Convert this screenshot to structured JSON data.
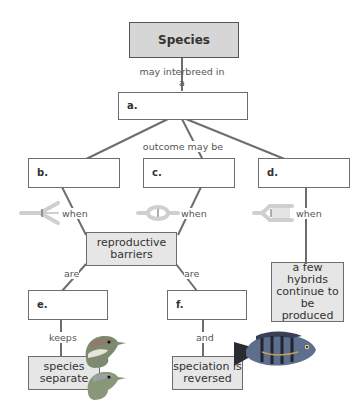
{
  "title_box": {
    "label": "Species"
  },
  "link_labels": {
    "may_interbreed": "may interbreed in a",
    "outcome": "outcome may be",
    "when_b": "when",
    "when_c": "when",
    "when_d": "when",
    "are_left": "are",
    "are_right": "are",
    "keeps": "keeps",
    "and": "and"
  },
  "blank_boxes": {
    "a": "a.",
    "b": "b.",
    "c": "c.",
    "d": "d.",
    "e": "e.",
    "f": "f."
  },
  "concept_boxes": {
    "reproductive_barriers": "reproductive barriers",
    "species_separate": "species separate",
    "speciation_reversed": "speciation is reversed",
    "hybrids_continue": "a few hybrids continue to be produced"
  },
  "icons": {
    "b": "diverging-hybrid-zone-icon",
    "c": "merging-hybrid-zone-icon",
    "d": "stable-hybrid-zone-icon",
    "birds": "bird-heads-image",
    "fish": "cichlid-fish-image"
  },
  "colors": {
    "line": "#6d6d6d",
    "gray_box": "#e6e6e6",
    "title_box": "#d6d6d6",
    "icon": "#cfcfcf"
  }
}
